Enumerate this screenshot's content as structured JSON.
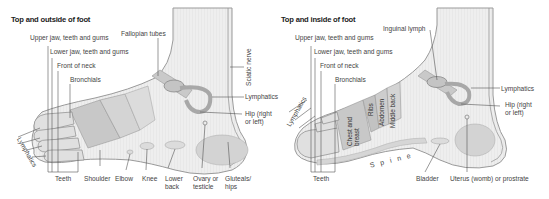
{
  "left": {
    "title": "Top and outside of foot",
    "labels": {
      "upper_jaw": "Upper jaw, teeth and gums",
      "lower_jaw": "Lower jaw, teeth and gums",
      "front_neck": "Front of neck",
      "bronchials": "Bronchials",
      "fallopian": "Fallopian tubes",
      "sciatic": "Sciatic nerve",
      "lymphatics": "Lymphatics",
      "hip_1": "Hip (right",
      "hip_2": "or left)",
      "lymphatics_toes": "Lymphatics",
      "teeth": "Teeth",
      "shoulder": "Shoulder",
      "elbow": "Elbow",
      "knee": "Knee",
      "lower_back_1": "Lower",
      "lower_back_2": "back",
      "ovary_1": "Ovary or",
      "ovary_2": "testicle",
      "gluteals_1": "Gluteals/",
      "gluteals_2": "hips"
    }
  },
  "right": {
    "title": "Top and inside of foot",
    "labels": {
      "inguinal": "Inguinal lymph",
      "upper_jaw": "Upper jaw, teeth and gums",
      "lower_jaw": "Lower jaw, teeth and gums",
      "front_neck": "Front of neck",
      "bronchials": "Bronchials",
      "lymphatics_toes": "Lymphatics",
      "lymphatics": "Lymphatics",
      "hip_1": "Hip (right",
      "hip_2": "or left)",
      "chest_1": "Chest and",
      "chest_2": "breast",
      "ribs": "Ribs",
      "abdomen": "Abdomen",
      "middle_back": "Middle back",
      "spine": "Spine",
      "teeth": "Teeth",
      "bladder": "Bladder",
      "uterus": "Uterus (womb) or prostrate"
    }
  },
  "colors": {
    "foot_fill": "#ececec",
    "foot_stroke": "#8a8a8a",
    "zone_dark": "#c6c6c6",
    "zone_mid": "#d6d6d6",
    "leader": "#555555"
  }
}
